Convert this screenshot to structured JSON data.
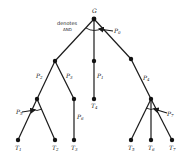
{
  "diagram": {
    "type": "and-or-tree",
    "annotation": {
      "line1": "denotes",
      "line2": "AND"
    },
    "root": {
      "id": "G",
      "label": "G"
    },
    "edge_labels": {
      "p0": {
        "base": "P",
        "sub": "0"
      },
      "p1": {
        "base": "P",
        "sub": "1"
      },
      "p2": {
        "base": "P",
        "sub": "2"
      },
      "p3": {
        "base": "P",
        "sub": "3"
      },
      "p4": {
        "base": "P",
        "sub": "4"
      },
      "p5": {
        "base": "P",
        "sub": "5"
      },
      "p6": {
        "base": "P",
        "sub": "6"
      },
      "p7": {
        "base": "P",
        "sub": "7"
      }
    },
    "leaves": [
      {
        "base": "T",
        "sub": "1"
      },
      {
        "base": "T",
        "sub": "2"
      },
      {
        "base": "T",
        "sub": "3"
      },
      {
        "base": "T",
        "sub": "4"
      },
      {
        "base": "T",
        "sub": "5"
      },
      {
        "base": "T",
        "sub": "6"
      },
      {
        "base": "T",
        "sub": "7"
      }
    ],
    "colors": {
      "line": "#1a1a1a",
      "node": "#111111",
      "background": "#ffffff"
    }
  }
}
